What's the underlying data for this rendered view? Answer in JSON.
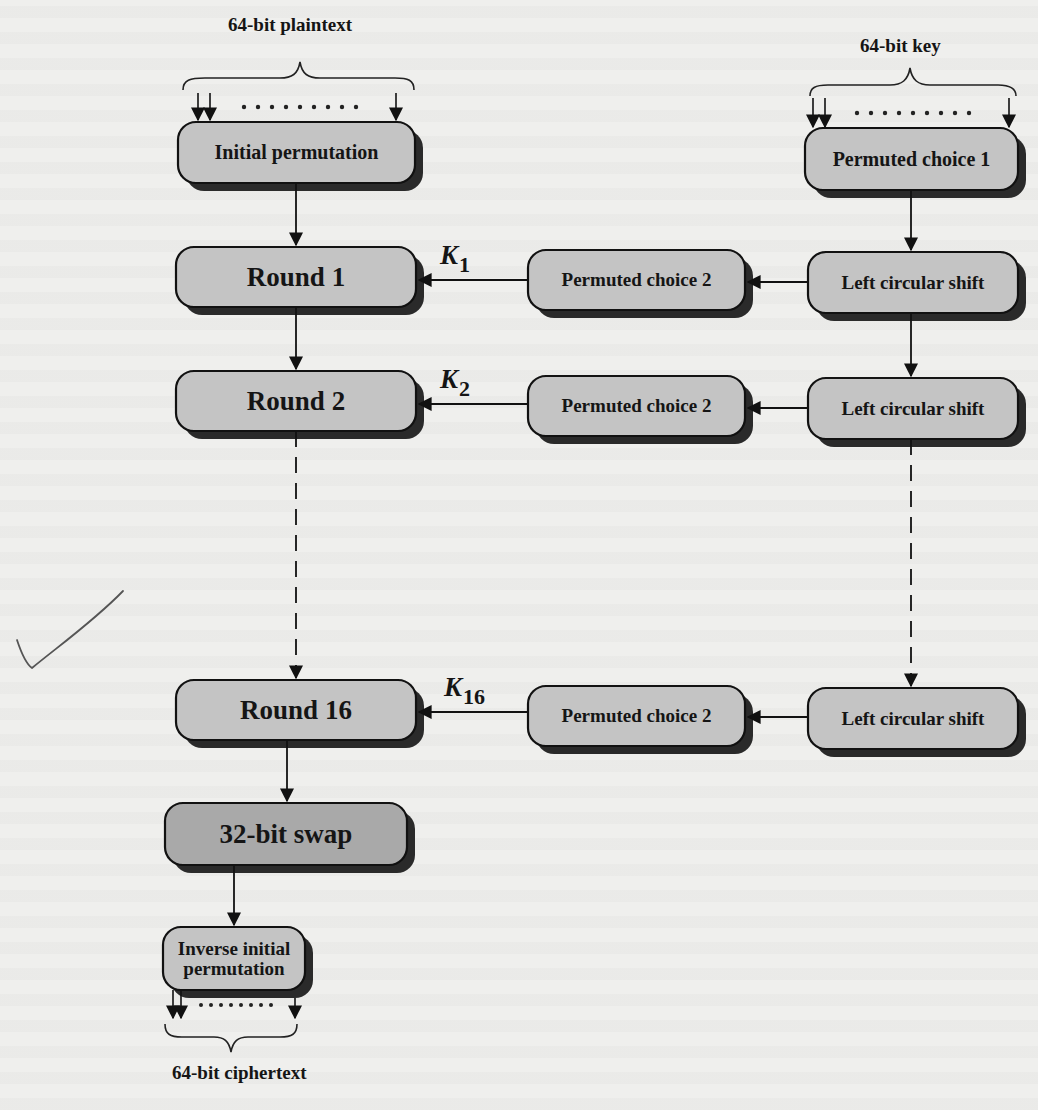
{
  "figure": {
    "inputs": {
      "plaintext_label": "64-bit plaintext",
      "key_label": "64-bit key"
    },
    "output": {
      "ciphertext_label": "64-bit ciphertext"
    },
    "boxes": {
      "initial_permutation": "Initial permutation",
      "permuted_choice_1": "Permuted choice 1",
      "round_1": "Round 1",
      "round_2": "Round 2",
      "round_16": "Round 16",
      "permuted_choice_2_a": "Permuted choice 2",
      "permuted_choice_2_b": "Permuted choice 2",
      "permuted_choice_2_c": "Permuted choice 2",
      "left_circular_shift_a": "Left circular shift",
      "left_circular_shift_b": "Left circular shift",
      "left_circular_shift_c": "Left circular shift",
      "swap_32bit": "32-bit swap",
      "inverse_initial_permutation": "Inverse initial permutation"
    },
    "subkeys": [
      {
        "symbol": "K",
        "index": "1"
      },
      {
        "symbol": "K",
        "index": "2"
      },
      {
        "symbol": "K",
        "index": "16"
      }
    ],
    "colors": {
      "box_fill": "#c4c4c4",
      "swap_fill": "#a9a9a9",
      "box_stroke": "#111111",
      "shadow": "#2a2a2a",
      "annotation_check": "#555555"
    },
    "annotation": "hand-drawn-checkmark"
  }
}
